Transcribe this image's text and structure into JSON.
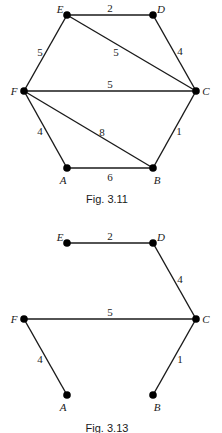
{
  "figures": [
    {
      "caption": "Fig. 3.11",
      "nodes": [
        {
          "id": "A",
          "label": "A"
        },
        {
          "id": "B",
          "label": "B"
        },
        {
          "id": "C",
          "label": "C"
        },
        {
          "id": "D",
          "label": "D"
        },
        {
          "id": "E",
          "label": "E"
        },
        {
          "id": "F",
          "label": "F"
        }
      ],
      "edges": [
        {
          "from": "E",
          "to": "D",
          "weight": "2"
        },
        {
          "from": "D",
          "to": "C",
          "weight": "4"
        },
        {
          "from": "E",
          "to": "C",
          "weight": "5"
        },
        {
          "from": "E",
          "to": "F",
          "weight": "5"
        },
        {
          "from": "F",
          "to": "C",
          "weight": "5"
        },
        {
          "from": "F",
          "to": "B",
          "weight": "8"
        },
        {
          "from": "F",
          "to": "A",
          "weight": "4"
        },
        {
          "from": "A",
          "to": "B",
          "weight": "6"
        },
        {
          "from": "B",
          "to": "C",
          "weight": "1"
        }
      ]
    },
    {
      "caption": "Fig. 3.13",
      "nodes": [
        {
          "id": "A",
          "label": "A"
        },
        {
          "id": "B",
          "label": "B"
        },
        {
          "id": "C",
          "label": "C"
        },
        {
          "id": "D",
          "label": "D"
        },
        {
          "id": "E",
          "label": "E"
        },
        {
          "id": "F",
          "label": "F"
        }
      ],
      "edges": [
        {
          "from": "E",
          "to": "D",
          "weight": "2"
        },
        {
          "from": "D",
          "to": "C",
          "weight": "4"
        },
        {
          "from": "F",
          "to": "C",
          "weight": "5"
        },
        {
          "from": "F",
          "to": "A",
          "weight": "4"
        },
        {
          "from": "B",
          "to": "C",
          "weight": "1"
        }
      ]
    }
  ]
}
